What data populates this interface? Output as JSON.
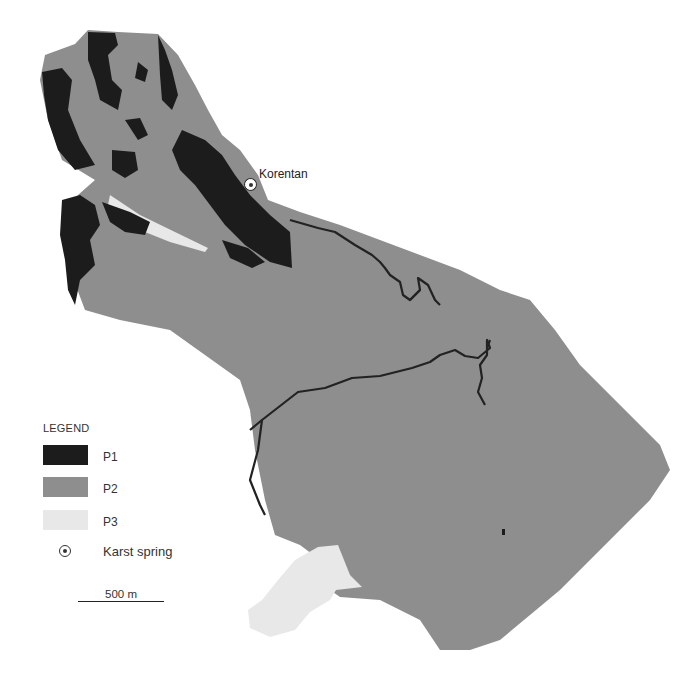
{
  "map": {
    "colors": {
      "P1": "#1c1c1c",
      "P2": "#8e8e8e",
      "P3": "#e8e8e8",
      "river": "#222222",
      "background": "#ffffff"
    },
    "place": {
      "name": "Korentan",
      "type": "Karst spring"
    }
  },
  "legend": {
    "title": "LEGEND",
    "items": [
      {
        "label": "P1",
        "color": "#1c1c1c"
      },
      {
        "label": "P2",
        "color": "#8e8e8e"
      },
      {
        "label": "P3",
        "color": "#e8e8e8"
      },
      {
        "label": "Karst spring",
        "symbol": "circle-dot"
      }
    ]
  },
  "scale": {
    "label": "500 m"
  }
}
